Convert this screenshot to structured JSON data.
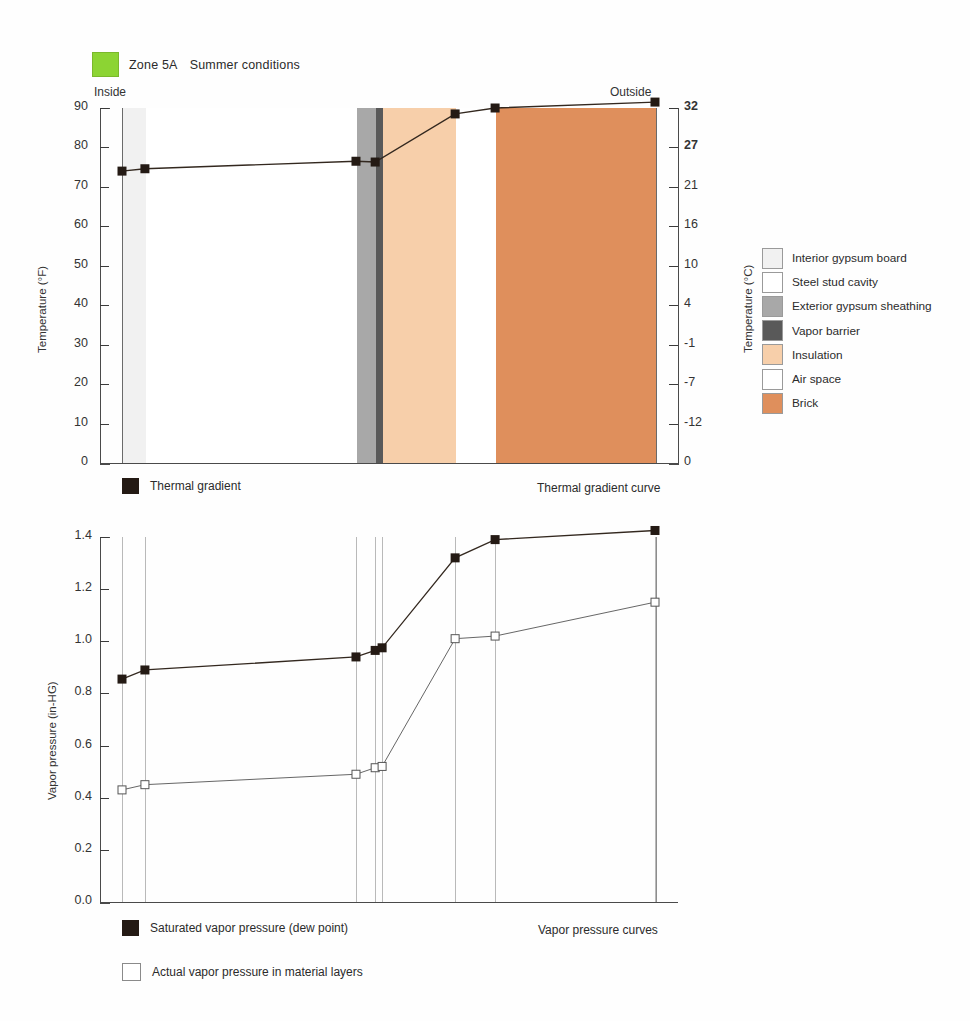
{
  "header": {
    "swatch_color": "#8CD433",
    "zone": "Zone 5A",
    "conditions": "Summer conditions"
  },
  "top_chart": {
    "inside_label": "Inside",
    "outside_label": "Outside",
    "y_left_title": "Temperature (°F)",
    "y_right_title": "Temperature (°C)",
    "y_left_ticks": [
      "90",
      "80",
      "70",
      "60",
      "50",
      "40",
      "30",
      "20",
      "10",
      "0"
    ],
    "y_right_ticks": [
      "32",
      "27",
      "21",
      "16",
      "10",
      "4",
      "-1",
      "-7",
      "-12",
      "0"
    ],
    "caption": "Thermal gradient curve",
    "legend_label": "Thermal gradient"
  },
  "bottom_chart": {
    "y_title": "Vapor pressure (in-HG)",
    "y_ticks": [
      "1.4",
      "1.2",
      "1.0",
      "0.8",
      "0.6",
      "0.4",
      "0.2",
      "0.0"
    ],
    "caption": "Vapor pressure curves",
    "legend": [
      {
        "label": "Saturated vapor pressure (dew point)",
        "style": "filled"
      },
      {
        "label": "Actual vapor pressure in material layers",
        "style": "open"
      }
    ]
  },
  "materials_legend": [
    {
      "label": "Interior gypsum board",
      "color": "#F1F1F1"
    },
    {
      "label": "Steel stud cavity",
      "color": "#FFFFFF"
    },
    {
      "label": "Exterior gypsum sheathing",
      "color": "#A8A8A8"
    },
    {
      "label": "Vapor barrier",
      "color": "#595959"
    },
    {
      "label": "Insulation",
      "color": "#F7CFAA"
    },
    {
      "label": "Air space",
      "color": "#FFFFFF"
    },
    {
      "label": "Brick",
      "color": "#DF8F5C"
    }
  ],
  "chart_data": [
    {
      "type": "line",
      "title": "Thermal gradient curve",
      "xlabel": "",
      "ylabel": "Temperature (°F)",
      "ylabel_right": "Temperature (°C)",
      "ylim": [
        0,
        90
      ],
      "ylim_right": [
        -18,
        32
      ],
      "grid": false,
      "legend": "Thermal gradient",
      "note": "Summer conditions, Zone 5A: heat flows inward from hot exterior (92°F) to cool interior (74°F).",
      "wall_layers": [
        {
          "name": "Interior gypsum board",
          "x_start": 0.0,
          "x_end": 4.3,
          "color": "#F1F1F1"
        },
        {
          "name": "Steel stud cavity",
          "x_start": 4.3,
          "x_end": 43.9,
          "color": "#FFFFFF"
        },
        {
          "name": "Exterior gypsum sheathing",
          "x_start": 43.9,
          "x_end": 47.5,
          "color": "#A8A8A8"
        },
        {
          "name": "Vapor barrier",
          "x_start": 47.5,
          "x_end": 48.8,
          "color": "#595959"
        },
        {
          "name": "Insulation",
          "x_start": 48.8,
          "x_end": 62.5,
          "color": "#F7CFAA"
        },
        {
          "name": "Air space",
          "x_start": 62.5,
          "x_end": 70.0,
          "color": "#FFFFFF"
        },
        {
          "name": "Brick",
          "x_start": 70.0,
          "x_end": 100.0,
          "color": "#DF8F5C"
        }
      ],
      "series": [
        {
          "name": "Thermal gradient",
          "marker": "filled-square",
          "x": [
            0.0,
            4.3,
            43.9,
            47.5,
            62.5,
            70.0,
            100.0
          ],
          "values": [
            74.0,
            74.6,
            76.5,
            76.3,
            88.5,
            90.0,
            91.5
          ]
        }
      ]
    },
    {
      "type": "line",
      "title": "Vapor pressure curves",
      "xlabel": "",
      "ylabel": "Vapor pressure (in-HG)",
      "ylim": [
        0.0,
        1.4
      ],
      "grid": true,
      "gridlines_x": [
        0.0,
        4.3,
        43.9,
        47.5,
        48.8,
        62.5,
        70.0,
        100.0
      ],
      "series": [
        {
          "name": "Saturated vapor pressure (dew point)",
          "marker": "filled-square",
          "x": [
            0.0,
            4.3,
            43.9,
            47.5,
            48.8,
            62.5,
            70.0,
            100.0
          ],
          "values": [
            0.855,
            0.89,
            0.94,
            0.965,
            0.975,
            1.32,
            1.39,
            1.425
          ]
        },
        {
          "name": "Actual vapor pressure in material layers",
          "marker": "open-square",
          "x": [
            0.0,
            4.3,
            43.9,
            47.5,
            48.8,
            62.5,
            70.0,
            100.0
          ],
          "values": [
            0.43,
            0.45,
            0.49,
            0.515,
            0.52,
            1.01,
            1.02,
            1.15
          ]
        }
      ]
    }
  ]
}
